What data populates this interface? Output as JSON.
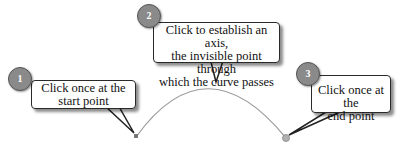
{
  "steps": [
    {
      "number": "1",
      "text_line1": "Click once at the",
      "text_line2": "start point"
    },
    {
      "number": "2",
      "text_line1": "Click to establish an axis,",
      "text_line2": "the invisible point through",
      "text_line3": "which the curve passes"
    },
    {
      "number": "3",
      "text_line1": "Click once at the",
      "text_line2": "end point"
    }
  ],
  "colors": {
    "curve": "#9a9a9a",
    "badge": "#8a8a8a",
    "start_point": "#777777",
    "end_point": "#aaaaaa"
  }
}
